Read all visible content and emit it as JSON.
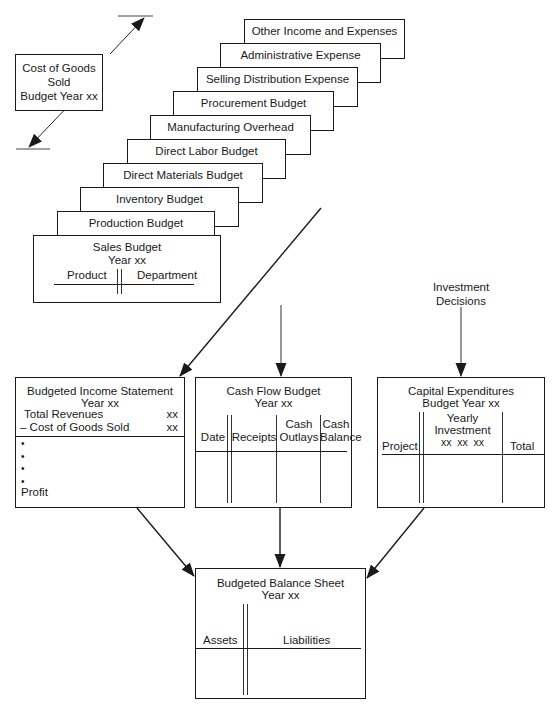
{
  "cogs_box": {
    "lines": [
      "Cost of Goods",
      "Sold",
      "Budget Year xx"
    ]
  },
  "budget_stack": [
    {
      "label": "Other Income and Expenses Budget"
    },
    {
      "label": "Administrative Expense Budget"
    },
    {
      "label": "Selling Distribution Expense Budget"
    },
    {
      "label": "Procurement Budget"
    },
    {
      "label": "Manufacturing Overhead Budget"
    },
    {
      "label": "Direct Labor Budget"
    },
    {
      "label": "Direct Materials Budget"
    },
    {
      "label": "Inventory Budget"
    },
    {
      "label": "Production Budget"
    }
  ],
  "sales_budget": {
    "title": "Sales Budget",
    "subtitle": "Year xx",
    "columns": [
      "Product",
      "Department"
    ]
  },
  "investment_decisions": {
    "lines": [
      "Investment",
      "Decisions"
    ]
  },
  "income_statement": {
    "title": "Budgeted Income Statement",
    "subtitle": "Year xx",
    "rows": [
      {
        "label": "Total Revenues",
        "value": "xx"
      },
      {
        "label": "– Cost of Goods Sold",
        "value": "xx"
      }
    ],
    "bullets": [
      "•",
      "•",
      "•",
      "•"
    ],
    "footer": "Profit"
  },
  "cash_flow": {
    "title": "Cash Flow Budget",
    "subtitle": "Year xx",
    "columns": [
      {
        "line1": "",
        "line2": "Date"
      },
      {
        "line1": "",
        "line2": "Receipts"
      },
      {
        "line1": "Cash",
        "line2": "Outlays"
      },
      {
        "line1": "Cash",
        "line2": "Balance"
      }
    ]
  },
  "capital_expenditures": {
    "title": "Capital Expenditures",
    "subtitle": "Budget Year xx",
    "columns": {
      "project": "Project",
      "yearly_line1": "Yearly",
      "yearly_line2": "Investment",
      "yearly_line3": "xx  xx  xx",
      "total": "Total"
    }
  },
  "balance_sheet": {
    "title": "Budgeted Balance Sheet",
    "subtitle": "Year xx",
    "columns": [
      "Assets",
      "Liabilities"
    ]
  },
  "colors": {
    "line": "#1a1a1a",
    "background": "#ffffff"
  }
}
